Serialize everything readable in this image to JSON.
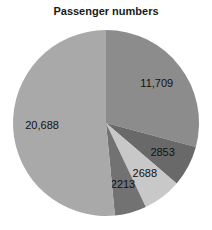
{
  "chart_data": {
    "type": "pie",
    "title": "Passenger numbers",
    "start": "12 o'clock",
    "direction": "clockwise",
    "slices": [
      {
        "label": "11,709",
        "value": 11709,
        "color": "#8c8c8c"
      },
      {
        "label": "2853",
        "value": 2853,
        "color": "#696969"
      },
      {
        "label": "2688",
        "value": 2688,
        "color": "#c8c8c8"
      },
      {
        "label": "2213",
        "value": 2213,
        "color": "#727272"
      },
      {
        "label": "20,688",
        "value": 20688,
        "color": "#a9a9a9"
      }
    ],
    "legend": "none"
  }
}
